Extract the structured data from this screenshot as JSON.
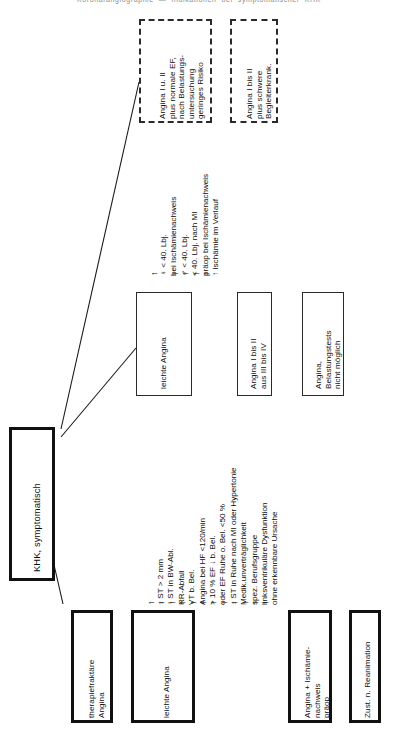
{
  "diagram": {
    "title": "KHK, symptomatisch",
    "page_top_cut_text": "Koronarangiographie  —  Indikationen  bei  symptomatischer  KHK",
    "root": {
      "label": "KHK, symptomatisch"
    },
    "dashed_boxes": [
      {
        "name": "angina-i-ii-normal-ef",
        "lines": [
          "Angina I u. II",
          "plus normale EF,",
          "nach Belastungs-",
          "untersuchung",
          "geringes Risiko"
        ]
      },
      {
        "name": "angina-i-ii-schwere-begleiterkrank",
        "lines": [
          "Angina I bis II",
          "plus schwere",
          "Begleiterkrank."
        ]
      }
    ],
    "mid_boxes": [
      {
        "name": "leichte-angina-upper",
        "lines": [
          "leichte Angina"
        ]
      },
      {
        "name": "angina-i-bis-ii-aus-iii-bis-iv",
        "lines": [
          "Angina I bis II",
          "aus III bis IV"
        ]
      },
      {
        "name": "angina-belastungstests-nicht-moeglich",
        "lines": [
          "Angina,",
          "Belastungstests",
          "nicht möglich"
        ]
      }
    ],
    "bottom_boxes": [
      {
        "name": "therapiefraktaere-angina",
        "lines": [
          "therapiefraktäre",
          "Angina"
        ]
      },
      {
        "name": "leichte-angina-lower",
        "lines": [
          "leichte Angina"
        ]
      },
      {
        "name": "angina-ischaemienachweis-praeop",
        "lines": [
          "Angina + Ischämie-",
          "nachweis",
          "präop"
        ]
      },
      {
        "name": "zustand-nach-reanimation",
        "lines": [
          "Zust. n. Reanimation"
        ]
      }
    ],
    "criteria_upper": {
      "name": "kriterien-leichte-angina-oben",
      "items": [
        {
          "arrow": "↑",
          "text": "♀ < 40. Lbj."
        },
        {
          "arrow": "",
          "text": "bei Ischämienachweis"
        },
        {
          "arrow": "↑",
          "text": "♂ < 40. Lbj."
        },
        {
          "arrow": "↑",
          "text": "< 40. Lbj. nach MI"
        },
        {
          "arrow": "↑",
          "text": "präop bei Ischämienachweis"
        },
        {
          "arrow": "↑",
          "text": "↑ Ischämie im Verlauf"
        }
      ]
    },
    "criteria_lower": {
      "name": "kriterien-leichte-angina-unten",
      "items": [
        {
          "arrow": "↑",
          "text": "↓ ST > 2 mm"
        },
        {
          "arrow": "↑",
          "text": "↑ ST in BW-Abl."
        },
        {
          "arrow": "↑",
          "text": "RR-Abfall"
        },
        {
          "arrow": "↑",
          "text": "VT b. Bel."
        },
        {
          "arrow": "↑",
          "text": "Angina bei HF <120/min"
        },
        {
          "arrow": "↑",
          "text": "> 10 % EF ↓ b. Bel."
        },
        {
          "arrow": "↑",
          "text": "oder EF Ruhe o. Bel. <50 %"
        },
        {
          "arrow": "↑",
          "text": "↓ ST in Ruhe nach MI oder Hypertonie"
        },
        {
          "arrow": "↑",
          "text": "Medik.unverträglichkeit"
        },
        {
          "arrow": "↑",
          "text": "spez. Berufsgruppe"
        },
        {
          "arrow": "↑",
          "text": "linksventrikuläre Dysfunktion"
        },
        {
          "arrow": "↑",
          "text": "ohne erkennbare Ursache"
        }
      ]
    }
  }
}
